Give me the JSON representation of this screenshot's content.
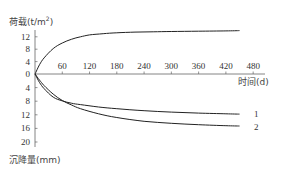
{
  "chart_data": {
    "type": "line",
    "title": "",
    "xlabel": "时间(d)",
    "ylabel_top": "荷载(t/m²)",
    "ylabel_bottom": "沉降量(mm)",
    "x_ticks": [
      60,
      120,
      180,
      240,
      300,
      360,
      420,
      480
    ],
    "y_ticks_top": [
      0,
      4,
      8,
      12
    ],
    "y_ticks_bottom": [
      4,
      8,
      12,
      16,
      20
    ],
    "xlim": [
      0,
      500
    ],
    "ylim_top": [
      0,
      14
    ],
    "ylim_bottom": [
      0,
      21
    ],
    "grid": false,
    "series": [
      {
        "name": "荷载",
        "axis": "top",
        "x": [
          0,
          10,
          20,
          40,
          60,
          80,
          100,
          120,
          150,
          180,
          220,
          260,
          300,
          360,
          420,
          450
        ],
        "values": [
          0,
          3.0,
          5.2,
          8.2,
          10.0,
          11.2,
          12.0,
          12.6,
          13.0,
          13.3,
          13.5,
          13.6,
          13.7,
          13.8,
          13.9,
          14.0
        ]
      },
      {
        "name": "1",
        "axis": "bottom",
        "x": [
          0,
          10,
          20,
          40,
          60,
          80,
          100,
          140,
          180,
          240,
          300,
          360,
          420,
          450
        ],
        "values": [
          0,
          2.5,
          4.3,
          6.8,
          7.9,
          8.6,
          9.0,
          9.7,
          10.2,
          10.8,
          11.2,
          11.5,
          11.7,
          11.8
        ]
      },
      {
        "name": "2",
        "axis": "bottom",
        "x": [
          0,
          10,
          20,
          40,
          60,
          80,
          100,
          140,
          180,
          240,
          300,
          360,
          420,
          450
        ],
        "values": [
          0,
          1.8,
          3.4,
          5.9,
          7.8,
          9.1,
          10.2,
          11.7,
          12.8,
          13.9,
          14.5,
          14.9,
          15.2,
          15.3
        ]
      }
    ],
    "annotations": [
      {
        "text": "1",
        "target": "series 1 end"
      },
      {
        "text": "2",
        "target": "series 2 end"
      }
    ]
  },
  "labels": {
    "y_top_title": "荷载(t/m",
    "y_top_sup": "2",
    "y_top_close": ")",
    "y_bottom_title": "沉降量(mm)",
    "x_title": "时间(d)",
    "curve1": "1",
    "curve2": "2"
  }
}
